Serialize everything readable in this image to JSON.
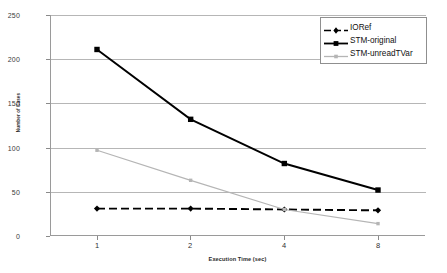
{
  "chart_data": {
    "type": "line",
    "title": "",
    "xlabel": "Execution Time (sec)",
    "ylabel": "Number of Cases",
    "categories": [
      "1",
      "2",
      "4",
      "8"
    ],
    "ylim": [
      0,
      250
    ],
    "yticks": [
      0,
      50,
      100,
      150,
      200,
      250
    ],
    "grid": true,
    "legend_position": "top-right",
    "series": [
      {
        "name": "IORef",
        "values": [
          31,
          31,
          30,
          29
        ],
        "color": "#000000",
        "style": "dashed",
        "marker": "diamond"
      },
      {
        "name": "STM-original",
        "values": [
          211,
          132,
          82,
          52
        ],
        "color": "#000000",
        "style": "solid",
        "marker": "square"
      },
      {
        "name": "STM-unreadTVar",
        "values": [
          97,
          63,
          30,
          14
        ],
        "color": "#b5b5b5",
        "style": "solid",
        "marker": "square-small"
      }
    ]
  },
  "axes": {
    "y_tick_labels": [
      "250",
      "200",
      "150",
      "100",
      "50",
      "0"
    ],
    "x_tick_labels": [
      "1",
      "2",
      "4",
      "8"
    ],
    "x_axis_title": "Execution Time (sec)",
    "y_axis_title": "Number of Cases"
  },
  "legend": {
    "entries": [
      {
        "label": "IORef"
      },
      {
        "label": "STM-original"
      },
      {
        "label": "STM-unreadTVar"
      }
    ]
  }
}
